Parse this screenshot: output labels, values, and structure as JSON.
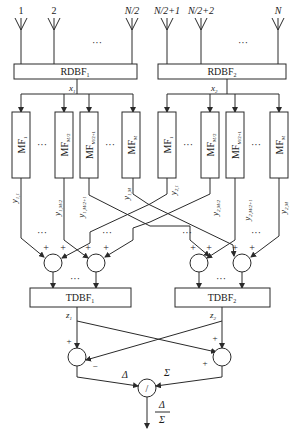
{
  "diagram": {
    "type": "block-diagram",
    "title": "",
    "colors": {
      "line": "#2a2a2a",
      "text": "#1a1a1a",
      "background": "#ffffff"
    },
    "antennas": {
      "group1": {
        "labels": [
          "1",
          "2",
          "N/2"
        ],
        "ellipsis": "···"
      },
      "group2": {
        "labels": [
          "N/2+1",
          "N/2+2",
          "N"
        ],
        "ellipsis": "···"
      }
    },
    "receive_beamformers": [
      {
        "label": "RDBF",
        "sub": "1",
        "output": "x",
        "output_sub": "1"
      },
      {
        "label": "RDBF",
        "sub": "2",
        "output": "x",
        "output_sub": "2"
      }
    ],
    "matched_filters": {
      "group1": [
        {
          "label": "MF",
          "sub": "1"
        },
        {
          "label": "MF",
          "sub": "M/2"
        },
        {
          "label": "MF",
          "sub": "M/2+1"
        },
        {
          "label": "MF",
          "sub": "M"
        }
      ],
      "group2": [
        {
          "label": "MF",
          "sub": "1"
        },
        {
          "label": "MF",
          "sub": "M/2"
        },
        {
          "label": "MF",
          "sub": "M/2+1"
        },
        {
          "label": "MF",
          "sub": "M"
        }
      ],
      "ellipsis": "···"
    },
    "mf_outputs": {
      "group1": [
        {
          "label": "y",
          "sub": "1,1"
        },
        {
          "label": "y",
          "sub": "1,M/2"
        },
        {
          "label": "y",
          "sub": "1,M/2+1"
        },
        {
          "label": "y",
          "sub": "1,M"
        }
      ],
      "group2": [
        {
          "label": "y",
          "sub": "2,1"
        },
        {
          "label": "y",
          "sub": "2,M/2"
        },
        {
          "label": "y",
          "sub": "2,M/2+1"
        },
        {
          "label": "y",
          "sub": "2,M"
        }
      ]
    },
    "adders": {
      "sign": "+",
      "ellipsis": "···",
      "count_shown": 4
    },
    "transmit_beamformers": [
      {
        "label": "TDBF",
        "sub": "1",
        "output": "z",
        "output_sub": "1"
      },
      {
        "label": "TDBF",
        "sub": "2",
        "output": "z",
        "output_sub": "2"
      }
    ],
    "combiner": {
      "plus": "+",
      "minus": "−",
      "difference": "Δ",
      "sum": "Σ",
      "divider_symbol": "/",
      "output_numerator": "Δ",
      "output_denominator": "Σ"
    }
  }
}
